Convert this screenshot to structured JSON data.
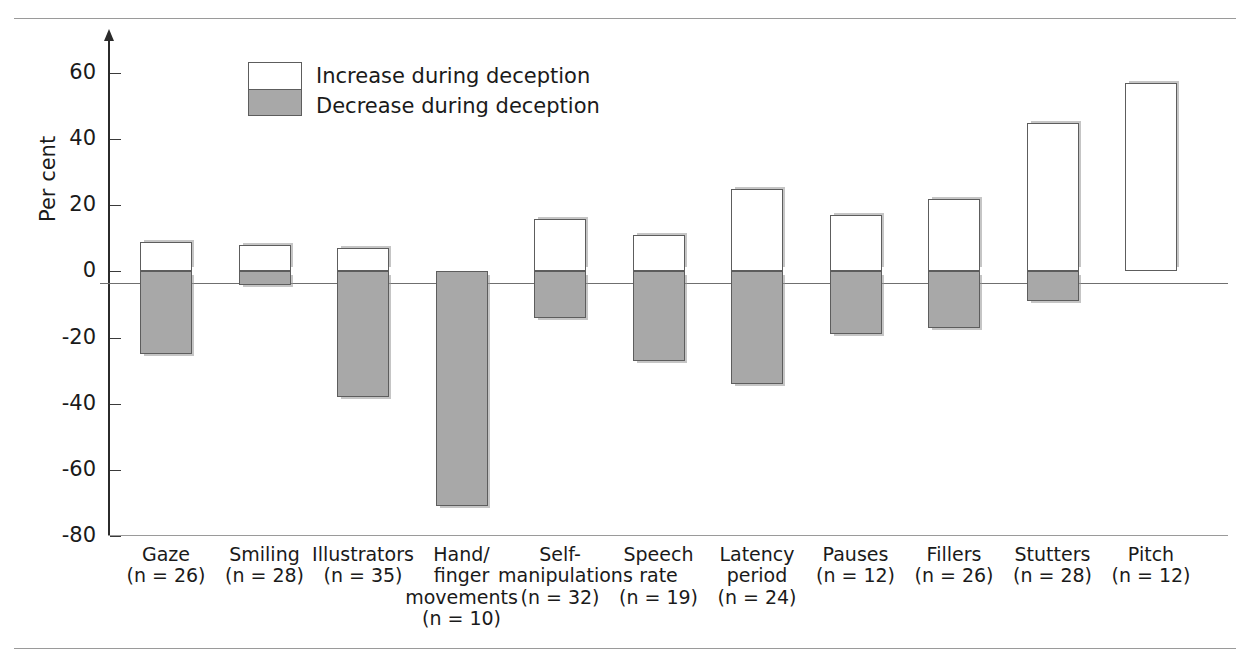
{
  "legend": {
    "increase_label": "Increase during deception",
    "decrease_label": "Decrease during deception",
    "increase_color": "#ffffff",
    "decrease_color": "#a8a8a8",
    "border_color": "#5d5d5d"
  },
  "axis": {
    "ylabel": "Per cent",
    "yticks": [
      60,
      40,
      20,
      0,
      -20,
      -40,
      -60,
      -80
    ],
    "ytick_labels": [
      "60",
      "40",
      "20",
      "0",
      "-20",
      "-40",
      "-60",
      "-80"
    ],
    "ylim": [
      -80,
      70
    ],
    "grid": false
  },
  "chart_data": {
    "type": "bar",
    "title": "",
    "subtitle": "",
    "xlabel": "",
    "ylabel": "Per cent",
    "ylim": [
      -80,
      70
    ],
    "grid": false,
    "legend_position": "top-left",
    "categories": [
      "Gaze",
      "Smiling",
      "Illustrators",
      "Hand/ finger movements",
      "Self- manipulations",
      "Speech rate",
      "Latency period",
      "Pauses",
      "Fillers",
      "Stutters",
      "Pitch"
    ],
    "category_labels": [
      [
        "Gaze",
        "(n = 26)"
      ],
      [
        "Smiling",
        "(n = 28)"
      ],
      [
        "Illustrators",
        "(n = 35)"
      ],
      [
        "Hand/",
        "finger",
        "movements",
        "(n = 10)"
      ],
      [
        "Self-",
        "manipulations",
        "(n = 32)"
      ],
      [
        "Speech",
        "rate",
        "(n = 19)"
      ],
      [
        "Latency",
        "period",
        "(n = 24)"
      ],
      [
        "Pauses",
        "(n = 12)"
      ],
      [
        "Fillers",
        "(n = 26)"
      ],
      [
        "Stutters",
        "(n = 28)"
      ],
      [
        "Pitch",
        "(n = 12)"
      ]
    ],
    "sample_sizes": [
      26,
      28,
      35,
      10,
      32,
      19,
      24,
      12,
      26,
      28,
      12
    ],
    "series": [
      {
        "name": "Increase during deception",
        "values": [
          9,
          8,
          7,
          0,
          16,
          11,
          25,
          17,
          22,
          45,
          57
        ]
      },
      {
        "name": "Decrease during deception",
        "values": [
          -25,
          -4,
          -38,
          -71,
          -14,
          -27,
          -34,
          -19,
          -17,
          -9,
          0
        ]
      }
    ]
  }
}
